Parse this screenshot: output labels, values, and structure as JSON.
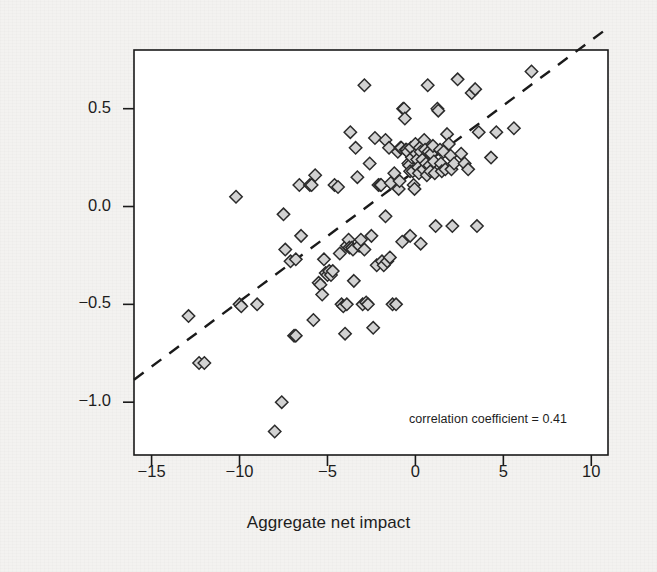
{
  "figure": {
    "background_color": "#f3f2f0",
    "frame_color": "#1a1a1a",
    "marker_fill": "#d2d2d2",
    "marker_stroke": "#2b2b2b",
    "trendline_color": "#1a1a1a"
  },
  "axes": {
    "x": {
      "label": "Aggregate net impact",
      "ticks": [
        -15,
        -10,
        -5,
        0,
        5,
        10
      ],
      "tick_labels": [
        "−15",
        "−10",
        "−5",
        "0",
        "5",
        "10"
      ],
      "range": [
        -16.0,
        10.95
      ]
    },
    "y": {
      "label": "Change in TFR 2010–50",
      "ticks": [
        0.5,
        0.0,
        -0.5,
        -1.0
      ],
      "tick_labels": [
        "0.5",
        "0.0",
        "−0.5",
        "−1.0"
      ],
      "range": [
        -1.27,
        0.8
      ]
    }
  },
  "annotation": {
    "correlation_text": "correlation coefficient = 0.41",
    "correlation_value": 0.41
  },
  "chart_data": {
    "type": "scatter",
    "title": "",
    "subtitle": "",
    "xlabel": "Aggregate net impact",
    "ylabel": "Change in TFR 2010–50",
    "xlim": [
      -16.0,
      10.95
    ],
    "ylim": [
      -1.27,
      0.8
    ],
    "xticks": [
      -15,
      -10,
      -5,
      0,
      5,
      10
    ],
    "yticks": [
      0.5,
      0.0,
      -0.5,
      -1.0
    ],
    "grid": false,
    "legend": null,
    "annotations": [
      {
        "text": "correlation coefficient = 0.41",
        "x": 3.4,
        "y": -1.11,
        "align": "left"
      }
    ],
    "marker": "diamond",
    "series": [
      {
        "name": "countries",
        "points": [
          [
            -12.9,
            -0.56
          ],
          [
            -12.3,
            -0.8
          ],
          [
            -12.0,
            -0.8
          ],
          [
            -10.2,
            0.05
          ],
          [
            -10.0,
            -0.5
          ],
          [
            -9.9,
            -0.51
          ],
          [
            -9.0,
            -0.5
          ],
          [
            -8.0,
            -1.15
          ],
          [
            -7.6,
            -1.0
          ],
          [
            -7.5,
            -0.04
          ],
          [
            -7.4,
            -0.22
          ],
          [
            -7.1,
            -0.28
          ],
          [
            -6.9,
            -0.66
          ],
          [
            -6.8,
            -0.66
          ],
          [
            -6.8,
            -0.27
          ],
          [
            -6.6,
            0.11
          ],
          [
            -6.5,
            -0.15
          ],
          [
            -6.0,
            0.11
          ],
          [
            -5.9,
            0.11
          ],
          [
            -5.8,
            -0.58
          ],
          [
            -5.7,
            0.16
          ],
          [
            -5.5,
            -0.39
          ],
          [
            -5.4,
            -0.4
          ],
          [
            -5.3,
            -0.45
          ],
          [
            -5.2,
            -0.27
          ],
          [
            -5.1,
            -0.34
          ],
          [
            -5.0,
            -0.35
          ],
          [
            -4.9,
            -0.33
          ],
          [
            -4.8,
            -0.35
          ],
          [
            -4.7,
            -0.33
          ],
          [
            -4.6,
            0.11
          ],
          [
            -4.4,
            0.1
          ],
          [
            -4.3,
            -0.24
          ],
          [
            -4.2,
            -0.5
          ],
          [
            -4.1,
            -0.51
          ],
          [
            -4.0,
            -0.65
          ],
          [
            -3.9,
            -0.5
          ],
          [
            -3.9,
            -0.2
          ],
          [
            -3.8,
            -0.17
          ],
          [
            -3.75,
            -0.21
          ],
          [
            -3.7,
            0.38
          ],
          [
            -3.6,
            -0.21
          ],
          [
            -3.55,
            -0.22
          ],
          [
            -3.5,
            -0.38
          ],
          [
            -3.4,
            0.3
          ],
          [
            -3.3,
            0.15
          ],
          [
            -3.2,
            -0.2
          ],
          [
            -3.1,
            -0.17
          ],
          [
            -3.0,
            -0.5
          ],
          [
            -2.9,
            0.62
          ],
          [
            -2.9,
            -0.22
          ],
          [
            -2.8,
            -0.49
          ],
          [
            -2.7,
            -0.5
          ],
          [
            -2.6,
            0.22
          ],
          [
            -2.5,
            -0.15
          ],
          [
            -2.4,
            -0.62
          ],
          [
            -2.3,
            0.35
          ],
          [
            -2.2,
            -0.3
          ],
          [
            -2.1,
            0.11
          ],
          [
            -2.0,
            0.11
          ],
          [
            -1.95,
            0.11
          ],
          [
            -1.9,
            -0.28
          ],
          [
            -1.8,
            -0.3
          ],
          [
            -1.7,
            0.34
          ],
          [
            -1.7,
            -0.05
          ],
          [
            -1.6,
            -0.28
          ],
          [
            -1.5,
            0.3
          ],
          [
            -1.45,
            -0.26
          ],
          [
            -1.4,
            0.12
          ],
          [
            -1.3,
            -0.5
          ],
          [
            -1.2,
            0.17
          ],
          [
            -1.1,
            -0.5
          ],
          [
            -1.0,
            0.28
          ],
          [
            -0.95,
            0.09
          ],
          [
            -0.9,
            0.13
          ],
          [
            -0.85,
            0.3
          ],
          [
            -0.8,
            0.3
          ],
          [
            -0.75,
            -0.18
          ],
          [
            -0.7,
            0.5
          ],
          [
            -0.65,
            0.5
          ],
          [
            -0.6,
            0.45
          ],
          [
            -0.55,
            0.29
          ],
          [
            -0.5,
            0.29
          ],
          [
            -0.45,
            0.28
          ],
          [
            -0.4,
            0.22
          ],
          [
            -0.35,
            0.21
          ],
          [
            -0.3,
            0.18
          ],
          [
            -0.3,
            -0.15
          ],
          [
            -0.25,
            0.3
          ],
          [
            -0.2,
            0.25
          ],
          [
            -0.15,
            0.18
          ],
          [
            -0.1,
            0.11
          ],
          [
            -0.05,
            0.09
          ],
          [
            0.0,
            0.32
          ],
          [
            0.05,
            0.27
          ],
          [
            0.1,
            0.24
          ],
          [
            0.15,
            0.2
          ],
          [
            0.2,
            0.17
          ],
          [
            0.25,
            0.3
          ],
          [
            0.3,
            0.28
          ],
          [
            0.3,
            -0.19
          ],
          [
            0.4,
            0.24
          ],
          [
            0.45,
            0.19
          ],
          [
            0.5,
            0.34
          ],
          [
            0.55,
            0.29
          ],
          [
            0.6,
            0.22
          ],
          [
            0.65,
            0.16
          ],
          [
            0.7,
            0.62
          ],
          [
            0.75,
            0.28
          ],
          [
            0.8,
            0.21
          ],
          [
            0.85,
            0.18
          ],
          [
            0.9,
            0.27
          ],
          [
            1.0,
            0.31
          ],
          [
            1.05,
            0.23
          ],
          [
            1.1,
            0.17
          ],
          [
            1.15,
            -0.1
          ],
          [
            1.25,
            0.5
          ],
          [
            1.3,
            0.49
          ],
          [
            1.4,
            0.29
          ],
          [
            1.45,
            0.22
          ],
          [
            1.5,
            0.18
          ],
          [
            1.6,
            0.28
          ],
          [
            1.7,
            0.19
          ],
          [
            1.8,
            0.37
          ],
          [
            1.9,
            0.32
          ],
          [
            2.0,
            0.26
          ],
          [
            2.05,
            0.19
          ],
          [
            2.1,
            -0.1
          ],
          [
            2.2,
            0.22
          ],
          [
            2.4,
            0.65
          ],
          [
            2.6,
            0.27
          ],
          [
            2.8,
            0.22
          ],
          [
            3.0,
            0.19
          ],
          [
            3.2,
            0.58
          ],
          [
            3.4,
            0.6
          ],
          [
            3.5,
            -0.1
          ],
          [
            3.6,
            0.38
          ],
          [
            4.3,
            0.25
          ],
          [
            4.6,
            0.38
          ],
          [
            5.6,
            0.4
          ],
          [
            6.6,
            0.69
          ]
        ]
      }
    ],
    "trendline": {
      "style": "dashed",
      "x": [
        -16.0,
        10.9
      ],
      "y": [
        -0.885,
        0.91
      ]
    }
  }
}
